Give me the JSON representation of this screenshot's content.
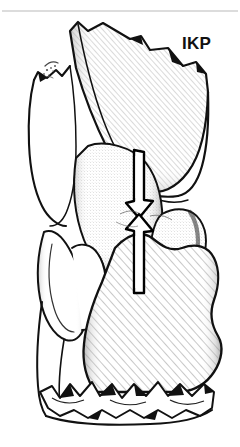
{
  "figure": {
    "kind": "scientific-line-drawing",
    "background_color": "#ffffff",
    "ink_color": "#000000",
    "hatch_color": "#8d8d8d",
    "rule_color": "#b9b9b9",
    "width": 240,
    "height": 447
  },
  "top_rule": {
    "name": "horizontal-rule",
    "y": 11,
    "x_start": 2,
    "x_end": 238,
    "color": "#b9b9b9"
  },
  "labels": {
    "ikp": {
      "text": "IKP",
      "x": 182,
      "y": 43,
      "color": "#111111",
      "font_size": 17,
      "bold": true
    }
  },
  "annotations": {
    "double_arrow": {
      "name": "double-headed-arrow",
      "orientation": "vertical",
      "description": "two opposed arrows meeting at a point, upper pointing down, lower pointing up",
      "center_x": 139,
      "top_y": 150,
      "bottom_y": 293,
      "meet_y": 216,
      "shaft_width": 10,
      "head_width": 28,
      "fill": "#ffffff",
      "stroke": "#000000"
    }
  },
  "parts": [
    {
      "name": "upper-tooth-crown",
      "shading": "diagonal-hatch",
      "position": "top"
    },
    {
      "name": "upper-tooth-root-left",
      "shading": "outline",
      "position": "upper-left"
    },
    {
      "name": "middle-tooth-cusp",
      "shading": "stipple",
      "position": "middle"
    },
    {
      "name": "lower-tooth-crown",
      "shading": "diagonal-hatch",
      "position": "bottom"
    },
    {
      "name": "broken-base-edge",
      "shading": "outline",
      "position": "bottom"
    }
  ],
  "caption": {
    "text": "",
    "x": 4,
    "y": 434,
    "color": "#c9c9c9"
  }
}
